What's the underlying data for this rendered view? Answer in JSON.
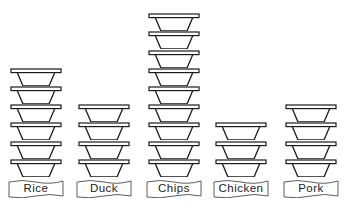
{
  "chart_data": {
    "type": "bar",
    "style": "pictogram",
    "icon": "bowl",
    "title": "",
    "xlabel": "",
    "ylabel": "",
    "categories": [
      "Rice",
      "Duck",
      "Chips",
      "Chicken",
      "Pork"
    ],
    "values": [
      6,
      4,
      9,
      3,
      4
    ],
    "grid": false,
    "legend": null
  },
  "labels": {
    "rice": "Rice",
    "duck": "Duck",
    "chips": "Chips",
    "chicken": "Chicken",
    "pork": "Pork"
  },
  "colors": {
    "stroke": "#1a1a1a",
    "background": "#ffffff"
  }
}
